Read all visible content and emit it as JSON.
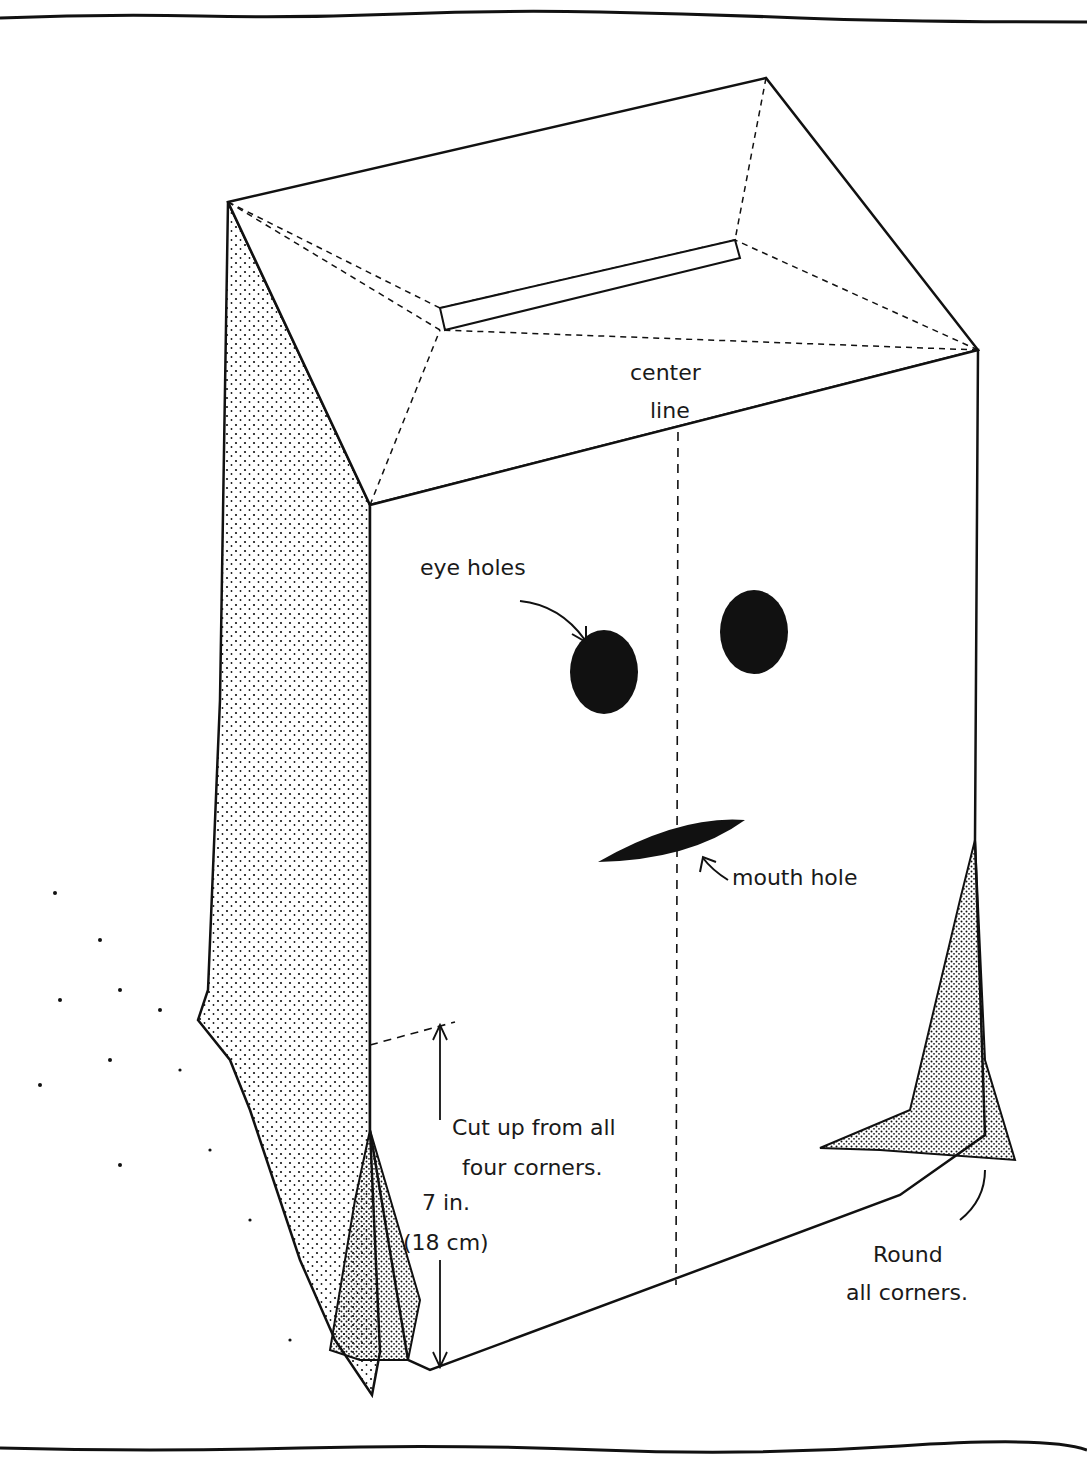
{
  "diagram": {
    "labels": {
      "center_line": [
        "center",
        "line"
      ],
      "eye_holes": "eye holes",
      "mouth_hole": "mouth hole",
      "cut_instruction": [
        "Cut up from all",
        "four corners."
      ],
      "measurement_in": "7 in.",
      "measurement_cm": "(18 cm)",
      "round_instruction": [
        "Round",
        "all corners."
      ]
    },
    "colors": {
      "ink": "#111111",
      "paper": "#ffffff"
    }
  }
}
